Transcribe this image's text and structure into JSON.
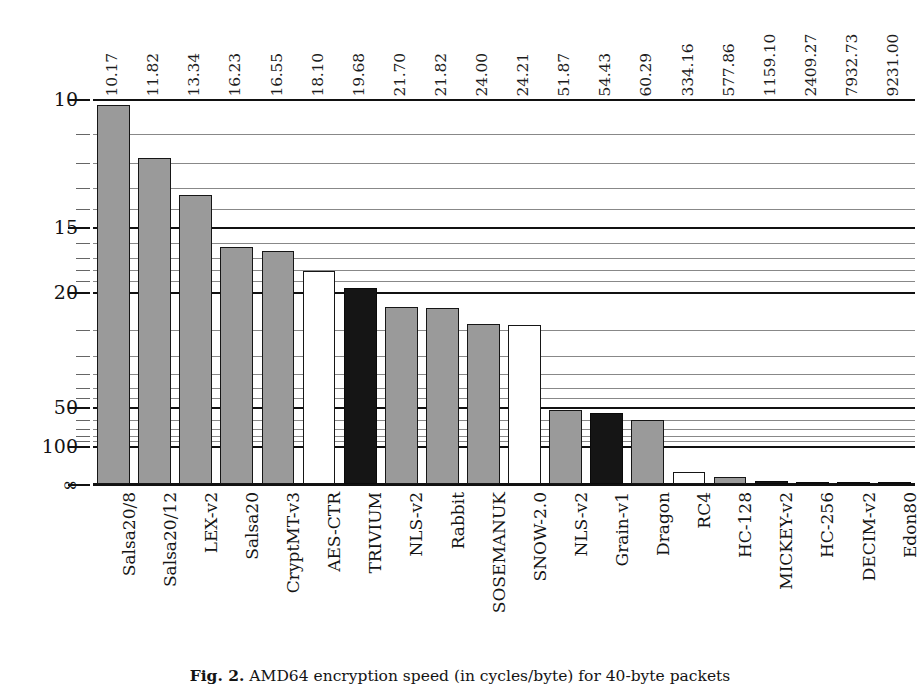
{
  "figure": {
    "caption_prefix": "Fig. 2.",
    "caption_text": "AMD64 encryption speed (in cycles/byte) for 40-byte packets"
  },
  "chart_data": {
    "type": "bar",
    "title": "",
    "xlabel": "",
    "ylabel": "cycles/byte",
    "scale": "reciprocal",
    "axis_note": "y-axis is inverted reciprocal: 10 at top, infinity at baseline",
    "ytick_labels": [
      "10",
      "15",
      "20",
      "50",
      "100",
      "∞"
    ],
    "ytick_values": [
      10,
      15,
      20,
      50,
      100,
      0
    ],
    "yminor_values": [
      11,
      12,
      13,
      14,
      16,
      17,
      18,
      19,
      25,
      30,
      35,
      40,
      45,
      60,
      70,
      80,
      90
    ],
    "grid": true,
    "legend": "none",
    "categories": [
      "Salsa20/8",
      "Salsa20/12",
      "LEX-v2",
      "Salsa20",
      "CryptMT-v3",
      "AES-CTR",
      "TRIVIUM",
      "NLS-v2",
      "Rabbit",
      "SOSEMANUK",
      "SNOW-2.0",
      "NLS-v2",
      "Grain-v1",
      "Dragon",
      "RC4",
      "HC-128",
      "MICKEY-v2",
      "HC-256",
      "DECIM-v2",
      "Edon80"
    ],
    "values": [
      10.17,
      11.82,
      13.34,
      16.23,
      16.55,
      18.1,
      19.68,
      21.7,
      21.82,
      24.0,
      24.21,
      51.87,
      54.43,
      60.29,
      334.16,
      577.86,
      1159.1,
      2409.27,
      7932.73,
      9231.0
    ],
    "value_labels": [
      "10.17",
      "11.82",
      "13.34",
      "16.23",
      "16.55",
      "18.10",
      "19.68",
      "21.70",
      "21.82",
      "24.00",
      "24.21",
      "51.87",
      "54.43",
      "60.29",
      "334.16",
      "577.86",
      "1159.10",
      "2409.27",
      "7932.73",
      "9231.00"
    ],
    "bar_styles": [
      "gray",
      "gray",
      "gray",
      "gray",
      "gray",
      "white",
      "black",
      "gray",
      "gray",
      "gray",
      "white",
      "gray",
      "black",
      "gray",
      "white",
      "gray",
      "black",
      "black",
      "black",
      "black"
    ],
    "colors": {
      "gray": "#9a9a9a",
      "white": "#ffffff",
      "black": "#151515",
      "outline": "#161616",
      "axis": "#111111",
      "gridline_minor": "#888888"
    }
  }
}
